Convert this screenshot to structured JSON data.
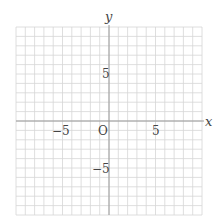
{
  "chart_data": {
    "type": "scatter",
    "title": "",
    "xlabel": "x",
    "ylabel": "y",
    "xlim": [
      -10,
      10
    ],
    "ylim": [
      -10,
      10
    ],
    "grid": true,
    "grid_step": 1,
    "origin_label": "O",
    "x_ticks": [
      {
        "value": -5,
        "label": "−5"
      },
      {
        "value": 5,
        "label": "5"
      }
    ],
    "y_ticks": [
      {
        "value": 5,
        "label": "5"
      },
      {
        "value": -5,
        "label": "−5"
      }
    ],
    "series": []
  },
  "colors": {
    "grid": "#d6d6d6",
    "axis": "#9a9a9a",
    "text": "#444444"
  }
}
